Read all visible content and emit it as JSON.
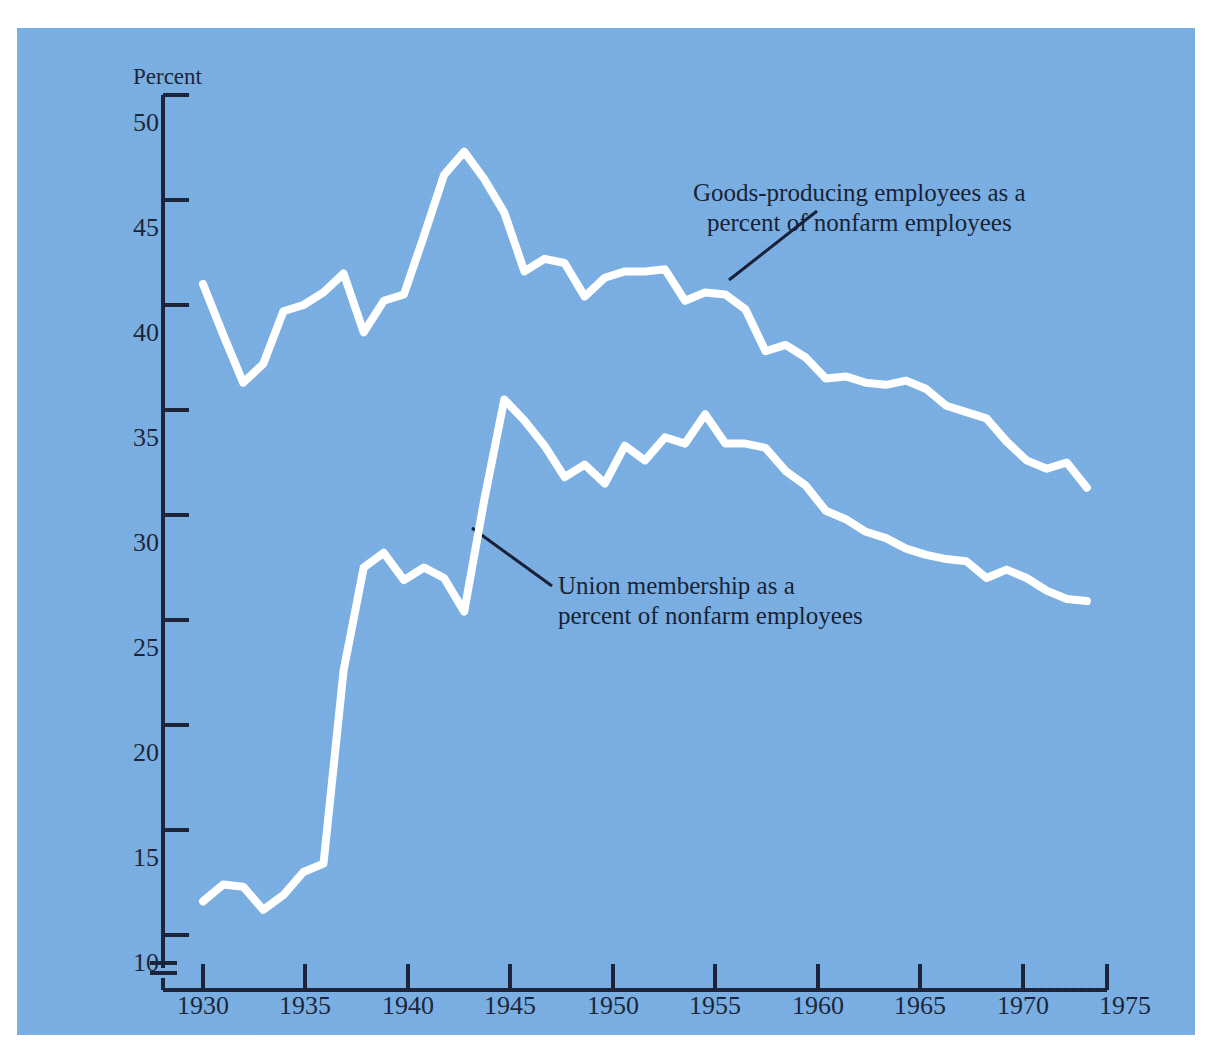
{
  "figure": {
    "background_color": "#76abe0",
    "line_color": "#ffffff",
    "axis_color": "#141c33",
    "text_color": "#10182e"
  },
  "axes": {
    "y_axis_title": "Percent",
    "y_ticks": [
      "50",
      "45",
      "40",
      "35",
      "30",
      "25",
      "20",
      "15",
      "10"
    ],
    "x_ticks": [
      "1930",
      "1935",
      "1940",
      "1945",
      "1950",
      "1955",
      "1960",
      "1965",
      "1970",
      "1975"
    ],
    "y_axis_break": true
  },
  "annotations": {
    "goods_line1": "Goods-producing employees as a",
    "goods_line2": "percent of nonfarm employees",
    "union_line1": "Union membership as a",
    "union_line2": "percent of nonfarm employees"
  },
  "chart_data": {
    "type": "line",
    "title": "",
    "xlabel": "",
    "ylabel": "Percent",
    "xlim": [
      1930,
      1975
    ],
    "ylim": [
      9,
      50
    ],
    "grid": false,
    "legend": "annotated-leader-lines",
    "x": [
      1930,
      1931,
      1932,
      1933,
      1934,
      1935,
      1936,
      1937,
      1938,
      1939,
      1940,
      1941,
      1942,
      1943,
      1944,
      1945,
      1946,
      1947,
      1948,
      1949,
      1950,
      1951,
      1952,
      1953,
      1954,
      1955,
      1956,
      1957,
      1958,
      1959,
      1960,
      1961,
      1962,
      1963,
      1964,
      1965,
      1966,
      1967,
      1968,
      1969,
      1970,
      1971,
      1972,
      1973,
      1974
    ],
    "series": [
      {
        "name": "Goods-producing employees as a percent of nonfarm employees",
        "values": [
          41.0,
          38.6,
          36.3,
          37.2,
          39.7,
          40.0,
          40.6,
          41.5,
          38.7,
          40.2,
          40.5,
          43.3,
          46.2,
          47.3,
          46.0,
          44.4,
          41.6,
          42.2,
          42.0,
          40.4,
          41.3,
          41.6,
          41.6,
          41.7,
          40.2,
          40.6,
          40.5,
          39.8,
          37.8,
          38.1,
          37.5,
          36.5,
          36.6,
          36.3,
          36.2,
          36.4,
          36.0,
          35.2,
          34.9,
          34.6,
          33.5,
          32.6,
          32.2,
          32.5,
          31.3
        ]
      },
      {
        "name": "Union membership as a percent of nonfarm employees",
        "values": [
          11.6,
          12.4,
          12.3,
          11.2,
          11.9,
          13.0,
          13.4,
          22.6,
          27.5,
          28.2,
          26.9,
          27.5,
          27.0,
          25.4,
          30.7,
          35.5,
          34.5,
          33.3,
          31.8,
          32.4,
          31.5,
          33.3,
          32.6,
          33.7,
          33.4,
          34.8,
          33.4,
          33.4,
          33.2,
          32.1,
          31.4,
          30.2,
          29.8,
          29.2,
          28.9,
          28.4,
          28.1,
          27.9,
          27.8,
          27.0,
          27.4,
          27.0,
          26.4,
          26.0,
          25.9
        ]
      }
    ]
  }
}
